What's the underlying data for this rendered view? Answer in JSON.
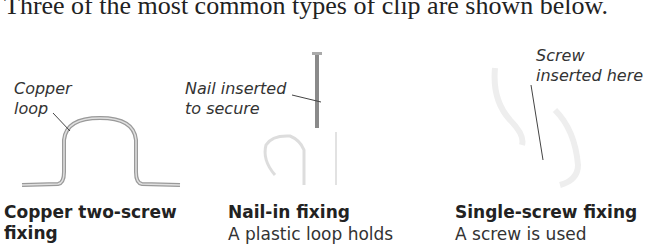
{
  "intro": "Three of the most common types of clip are shown below.",
  "clips": [
    {
      "title": "Copper two-screw",
      "title_line2": "fixing",
      "annotation": [
        "Copper",
        "loop"
      ]
    },
    {
      "title": "Nail-in fixing",
      "description": "A plastic loop holds",
      "annotation": [
        "Nail inserted",
        "to secure"
      ]
    },
    {
      "title": "Single-screw fixing",
      "description": "A screw is used",
      "annotation": [
        "Screw",
        "inserted here"
      ]
    }
  ]
}
